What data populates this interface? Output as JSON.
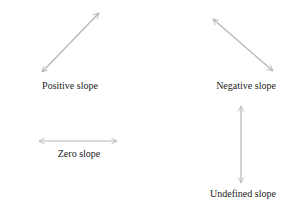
{
  "diagram": {
    "line_color": "#b5b5b5",
    "text_color": "#222222",
    "panels": [
      {
        "id": "positive",
        "label": "Positive slope",
        "arrow": {
          "x1": 42,
          "y1": 72,
          "x2": 99,
          "y2": 13
        },
        "label_pos": {
          "x": 70,
          "y": 81
        }
      },
      {
        "id": "negative",
        "label": "Negative slope",
        "arrow": {
          "x1": 213,
          "y1": 19,
          "x2": 273,
          "y2": 71
        },
        "label_pos": {
          "x": 246,
          "y": 81
        }
      },
      {
        "id": "zero",
        "label": "Zero slope",
        "arrow": {
          "x1": 39,
          "y1": 141,
          "x2": 117,
          "y2": 141
        },
        "label_pos": {
          "x": 79,
          "y": 149
        }
      },
      {
        "id": "undefined",
        "label": "Undefined slope",
        "arrow": {
          "x1": 241,
          "y1": 106,
          "x2": 241,
          "y2": 183
        },
        "label_pos": {
          "x": 243,
          "y": 189
        }
      }
    ]
  }
}
